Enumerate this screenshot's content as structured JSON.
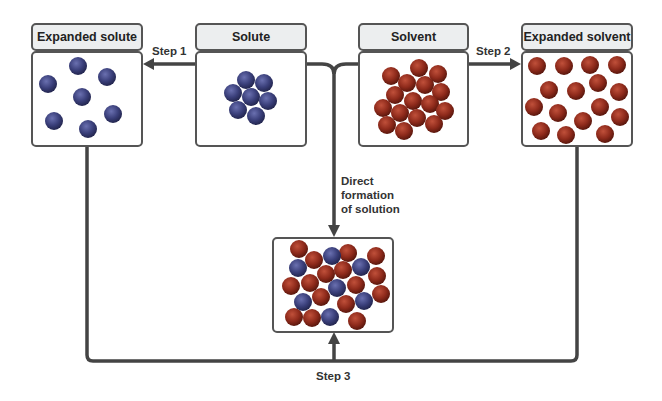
{
  "diagram": {
    "boxes": {
      "expanded_solute": {
        "title": "Expanded solute"
      },
      "solute": {
        "title": "Solute"
      },
      "solvent": {
        "title": "Solvent"
      },
      "expanded_solvent": {
        "title": "Expanded solvent"
      },
      "solution": {
        "title": ""
      }
    },
    "arrows": {
      "step1": "Step 1",
      "step2": "Step 2",
      "step3": "Step 3",
      "direct_line1": "Direct",
      "direct_line2": "formation",
      "direct_line3": "of solution"
    },
    "colors": {
      "solute_particle": "#3a3f7a",
      "solvent_particle": "#8e2a1b",
      "line": "#444444",
      "header_bg": "#eceeef"
    }
  }
}
